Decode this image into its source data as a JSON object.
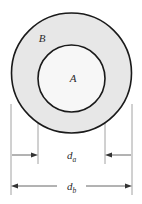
{
  "figure": {
    "background_color": "#ffffff",
    "regions": [
      {
        "id": "outer",
        "label": "B",
        "shape": "circle",
        "fill_color": "#e7e7e7",
        "stroke_color": "#1a1a1a",
        "center_x": 71.5,
        "center_y": 73,
        "radius": 60,
        "label_x": 42,
        "label_y": 42
      },
      {
        "id": "inner",
        "label": "A",
        "shape": "circle",
        "fill_color": "#f7f7f7",
        "stroke_color": "#1a1a1a",
        "center_x": 71.5,
        "center_y": 78.5,
        "radius": 33.5,
        "label_x": 73,
        "label_y": 82
      }
    ],
    "dimensions": [
      {
        "id": "da",
        "symbol": "d",
        "subscript": "a",
        "label": "da",
        "measures": "inner circle diameter",
        "line_y": 155,
        "left_x": 38,
        "right_x": 105,
        "arrow_direction": "inward",
        "label_x": 71.5,
        "label_y": 159
      },
      {
        "id": "db",
        "symbol": "d",
        "subscript": "b",
        "label": "db",
        "measures": "outer circle diameter",
        "line_y": 186,
        "left_x": 11,
        "right_x": 132,
        "arrow_direction": "outward",
        "label_x": 71.5,
        "label_y": 190
      }
    ],
    "extension_lines": [
      {
        "id": "ext-inner-left",
        "x": 38,
        "y_top": 73,
        "y_bottom": 164
      },
      {
        "id": "ext-inner-right",
        "x": 105,
        "y_top": 73,
        "y_bottom": 164
      },
      {
        "id": "ext-outer-left",
        "x": 11,
        "y_top": 104,
        "y_bottom": 195
      },
      {
        "id": "ext-outer-right",
        "x": 132,
        "y_top": 104,
        "y_bottom": 195
      }
    ],
    "line_color": "#555555",
    "stroke_color": "#1a1a1a"
  }
}
